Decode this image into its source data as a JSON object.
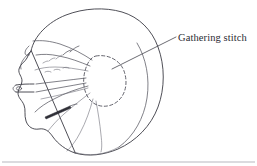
{
  "figure": {
    "kind": "line-drawing",
    "background_color": "#ffffff",
    "ink_color": "#3b3b44",
    "dashed_ink_color": "#52525c",
    "rule_color": "#9a9aa4",
    "width": 257,
    "height": 166
  },
  "annotations": {
    "gathering_stitch": {
      "label": "Gathering stitch",
      "leader_from": "dashed-oval",
      "leader_to": "label-text"
    }
  },
  "parts": {
    "bag_outline_name": "fabric-bag-outline",
    "gathered_folds_name": "gathered-fold-lines",
    "dashed_oval_name": "gathering-stitch-oval",
    "needle_name": "sewing-needle",
    "thread_name": "thread-lines",
    "baseline_rule_name": "bottom-rule"
  }
}
